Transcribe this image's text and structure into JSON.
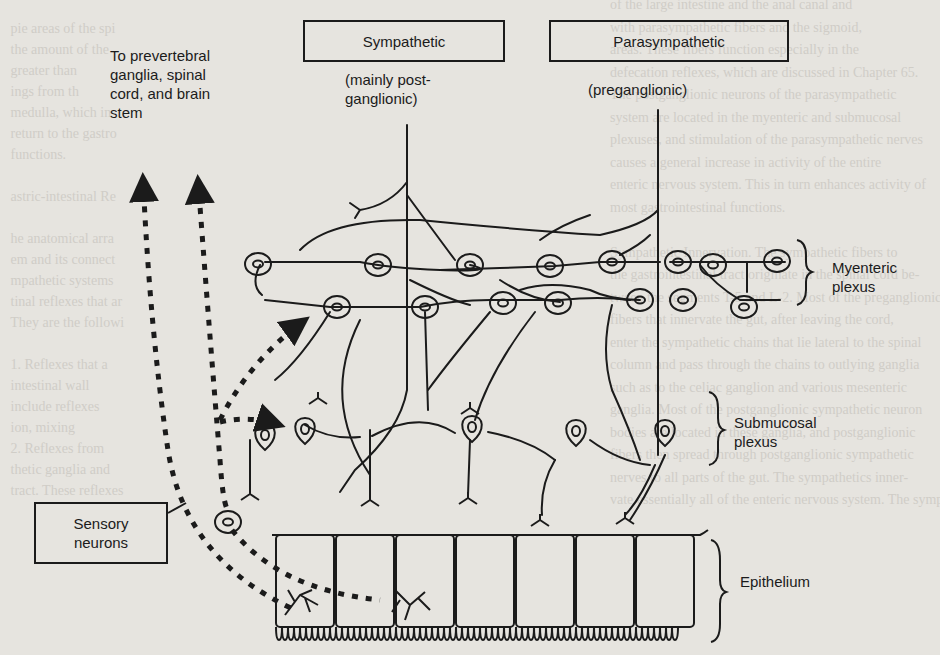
{
  "figure": {
    "title_boxes": {
      "sympathetic": "Sympathetic",
      "parasympathetic": "Parasympathetic"
    },
    "subtitles": {
      "sympathetic_line1": "(mainly post-",
      "sympathetic_line2": "ganglionic)",
      "parasympathetic": "(preganglionic)"
    },
    "top_left_label": {
      "line1": "To prevertebral",
      "line2": "ganglia, spinal",
      "line3": "cord, and brain",
      "line4": "stem"
    },
    "sensory_box": {
      "line1": "Sensory",
      "line2": "neurons"
    },
    "layer_labels": {
      "myenteric_line1": "Myenteric",
      "myenteric_line2": "plexus",
      "submucosal_line1": "Submucosal",
      "submucosal_line2": "plexus",
      "epithelium": "Epithelium"
    },
    "colors": {
      "ink": "#1b1b1b",
      "paper": "#e6e4df",
      "bleed_text": "#c9c6bf"
    }
  },
  "background_text": {
    "left_column": [
      "   pie areas of the spi",
      "   the amount of the",
      "   greater than",
      "   ings from th",
      "   medulla, which in",
      "   return to the gastro",
      "   functions.",
      "",
      "   astric-intestinal Re",
      "",
      "   he anatomical arra",
      "   em and its connect",
      "   mpathetic systems",
      "   tinal reflexes that ar",
      "   They are the followi",
      "",
      "   1. Reflexes that a",
      "   intestinal wall",
      "   include reflexes",
      "   ion, mixing",
      "   2. Reflexes from",
      "   thetic ganglia and",
      "   tract. These reflexes"
    ],
    "right_column": [
      "of the large intestine and the anal canal and",
      "with parasympathetic fibers and the sigmoid,",
      "areas. These fibers function especially in the",
      "defecation reflexes, which are discussed in Chapter 65.",
      "The postganglionic neurons of the parasympathetic",
      "system are located in the myenteric and submucosal",
      "plexuses, and stimulation of the parasympathetic nerves",
      "causes a general increase in activity of the entire",
      "enteric nervous system. This in turn enhances activity of",
      "most gastrointestinal functions.",
      "",
      "Sympathetic Innervation. The sympathetic fibers to",
      "the gastrointestinal tract originate in the spinal cord be-",
      "tween the segments T-5 and L-2. Most of the preganglionic",
      "fibers that innervate the gut, after leaving the cord,",
      "enter the sympathetic chains that lie lateral to the spinal",
      "column and pass through the chains to outlying ganglia",
      "such as to the celiac ganglion and various mesenteric",
      "ganglia. Most of the postganglionic sympathetic neuron",
      "bodies are located in these ganglia, and postganglionic",
      "fibers then spread through postganglionic sympathetic",
      "nerves to all parts of the gut. The sympathetics inner-",
      "vate essentially all of the enteric nervous system. The sympathetics"
    ]
  }
}
